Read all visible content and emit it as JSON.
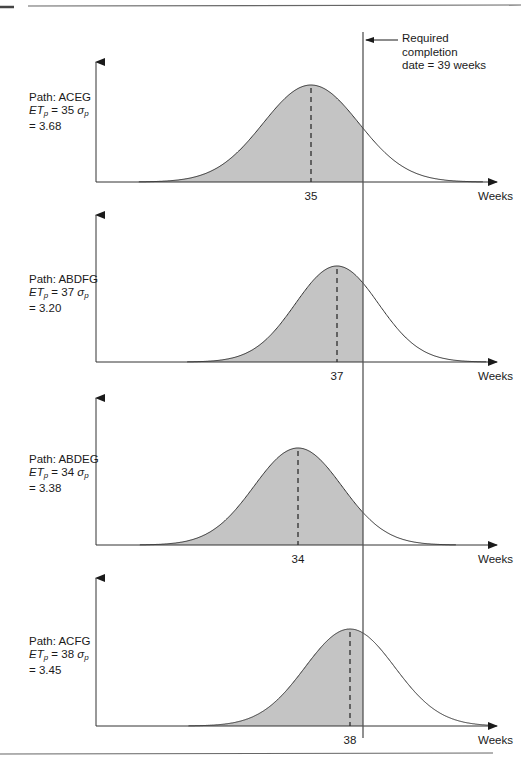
{
  "figure": {
    "required_date_label_lines": [
      "Required",
      "completion",
      "date = 39 weeks"
    ],
    "x_axis_label": "Weeks",
    "required_week": 39
  },
  "colors": {
    "shade": "#c4c4c4",
    "line": "#333333",
    "rule": "#555555"
  },
  "chart_data": [
    {
      "type": "area",
      "title": "Path: ACEG",
      "path": "ACEG",
      "ET_p": 35,
      "sigma_p": 3.68,
      "mean_label": "35",
      "xlabel": "Weeks",
      "shaded_region": "x <= 39",
      "reference_line": 39,
      "reference_label": "Required completion date = 39 weeks"
    },
    {
      "type": "area",
      "title": "Path: ABDFG",
      "path": "ABDFG",
      "ET_p": 37,
      "sigma_p": 3.2,
      "mean_label": "37",
      "xlabel": "Weeks",
      "shaded_region": "x <= 39",
      "reference_line": 39
    },
    {
      "type": "area",
      "title": "Path: ABDEG",
      "path": "ABDEG",
      "ET_p": 34,
      "sigma_p": 3.38,
      "mean_label": "34",
      "xlabel": "Weeks",
      "shaded_region": "x <= 39",
      "reference_line": 39
    },
    {
      "type": "area",
      "title": "Path: ACFG",
      "path": "ACFG",
      "ET_p": 38,
      "sigma_p": 3.45,
      "mean_label": "38",
      "xlabel": "Weeks",
      "shaded_region": "x <= 39",
      "reference_line": 39
    }
  ],
  "panels": [
    {
      "path_label": "Path: ACEG",
      "et_value": "= 35",
      "sigma_value": "= 3.68",
      "mean_label": "35"
    },
    {
      "path_label": "Path: ABDFG",
      "et_value": "= 37",
      "sigma_value": "= 3.20",
      "mean_label": "37"
    },
    {
      "path_label": "Path: ABDEG",
      "et_value": "= 34",
      "sigma_value": "= 3.38",
      "mean_label": "34"
    },
    {
      "path_label": "Path: ACFG",
      "et_value": "= 38",
      "sigma_value": "= 3.45",
      "mean_label": "38"
    }
  ]
}
